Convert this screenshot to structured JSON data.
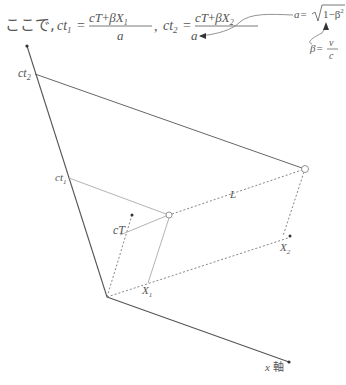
{
  "header": {
    "prefix": "ここで,",
    "eq1": {
      "lhs": "ct",
      "lhs_sub": "1",
      "num_a": "cT",
      "num_op": "+",
      "num_b": "βX",
      "num_b_sub": "1",
      "den": "a"
    },
    "sep": ",",
    "eq2": {
      "lhs": "ct",
      "lhs_sub": "2",
      "num_a": "cT",
      "num_op": "+",
      "num_b": "βX",
      "num_b_sub": "2",
      "den": "a"
    }
  },
  "annotations": {
    "a_def": {
      "lhs": "a",
      "eq": "=",
      "root_arg": "1−β",
      "power": "2"
    },
    "beta_def": {
      "lhs": "β",
      "eq": "=",
      "num": "v",
      "den": "c"
    }
  },
  "diagram": {
    "labels": {
      "ct2": {
        "base": "ct",
        "sub": "2"
      },
      "ct1": {
        "base": "ct",
        "sub": "1"
      },
      "cT": "cT",
      "L": "L",
      "X1": {
        "base": "X",
        "sub": "1"
      },
      "X2": {
        "base": "X",
        "sub": "2"
      },
      "x_axis": {
        "var": "x",
        "text": "軸"
      }
    },
    "colors": {
      "axis": "#555555",
      "solid_line": "#666666",
      "light_line": "#aaaaaa",
      "dashed": "#777777"
    }
  }
}
